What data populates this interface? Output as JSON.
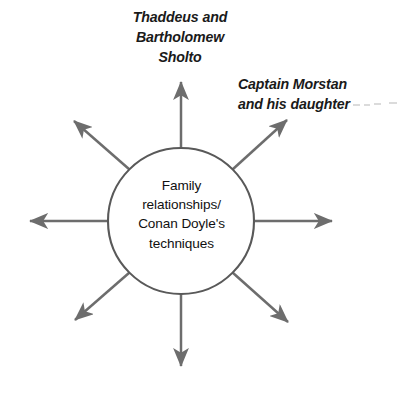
{
  "diagram": {
    "type": "spider-burst",
    "title_in_center": "Family\nrelationships/\nConan Doyle's\ntechniques",
    "center": {
      "text": "Family\nrelationships/\nConan Doyle's\ntechniques",
      "shape": "circle",
      "stroke_color": "#595959",
      "fill_color": "#ffffff"
    },
    "arrow_color": "#6d6d6d",
    "labels": [
      {
        "id": "sholto",
        "text": "Thaddeus and\nBartholomew\nSholto",
        "position": "top",
        "style": "italic"
      },
      {
        "id": "morstan",
        "text": "Captain Morstan\nand his daughter",
        "position": "top-right",
        "style": "italic",
        "trailing": "faint-dashes"
      }
    ],
    "spokes": [
      {
        "id": "north",
        "label_id": "sholto",
        "direction": "up"
      },
      {
        "id": "north-east",
        "label_id": "morstan",
        "direction": "up-right"
      },
      {
        "id": "east",
        "label_id": null,
        "direction": "right"
      },
      {
        "id": "south-east",
        "label_id": null,
        "direction": "down-right"
      },
      {
        "id": "south",
        "label_id": null,
        "direction": "down"
      },
      {
        "id": "south-west",
        "label_id": null,
        "direction": "down-left"
      },
      {
        "id": "west",
        "label_id": null,
        "direction": "left"
      },
      {
        "id": "north-west",
        "label_id": null,
        "direction": "up-left"
      }
    ]
  }
}
